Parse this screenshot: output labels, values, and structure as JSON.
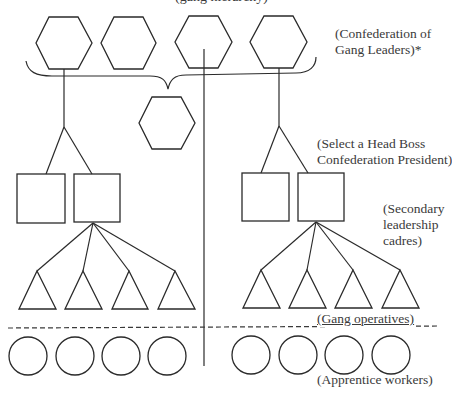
{
  "diagram": {
    "title_partial": "(gang hierarchy)",
    "labels": {
      "confederation": [
        "(Confederation of",
        "Gang Leaders)*"
      ],
      "head_boss": [
        "(Select a Head Boss",
        "Confederation President)"
      ],
      "secondary": [
        "(Secondary",
        "leadership",
        "cadres)"
      ],
      "operatives": "(Gang operatives)",
      "apprentices": "(Apprentice workers)"
    },
    "stroke_color": "#2a2a2a",
    "tiers": [
      {
        "name": "gang-leaders",
        "shape": "hexagon",
        "count": 4
      },
      {
        "name": "confederation-president",
        "shape": "hexagon",
        "count": 1
      },
      {
        "name": "secondary-leadership-cadres",
        "shape": "square",
        "count": 4
      },
      {
        "name": "gang-operatives",
        "shape": "triangle",
        "count": 8
      },
      {
        "name": "apprentice-workers",
        "shape": "circle",
        "count": 8
      }
    ]
  }
}
